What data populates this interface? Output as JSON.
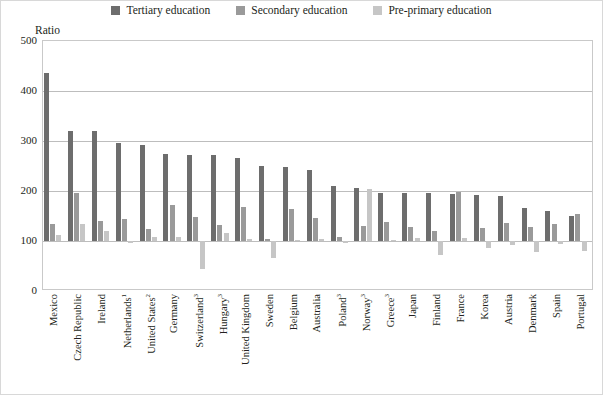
{
  "chart_data": {
    "type": "bar",
    "title": "",
    "ylabel": "Ratio",
    "xlabel": "",
    "ylim": [
      0,
      500
    ],
    "yticks": [
      0,
      100,
      200,
      300,
      400,
      500
    ],
    "baseline": 100,
    "grid": true,
    "legend_position": "top-center",
    "categories": [
      "Mexico",
      "Czech Republic",
      "Ireland",
      "Netherlands¹",
      "United States²",
      "Germany",
      "Switzerland³",
      "Hungary³",
      "United Kingdom",
      "Sweden",
      "Belgium",
      "Australia",
      "Poland³",
      "Norway³",
      "Greece³",
      "Japan",
      "Finland",
      "France",
      "Korea",
      "Austria",
      "Denmark",
      "Spain",
      "Portugal"
    ],
    "series": [
      {
        "name": "Tertiary education",
        "color": "#6d6d6d",
        "values": [
          437,
          320,
          320,
          297,
          293,
          275,
          272,
          272,
          266,
          250,
          248,
          243,
          210,
          207,
          197,
          196,
          196,
          194,
          192,
          190,
          166,
          161,
          150
        ]
      },
      {
        "name": "Secondary education",
        "color": "#9a9a9a",
        "values": [
          135,
          196,
          140,
          144,
          125,
          172,
          148,
          132,
          168,
          105,
          165,
          146,
          108,
          130,
          139,
          128,
          121,
          198,
          126,
          136,
          128,
          134,
          155
        ]
      },
      {
        "name": "Pre-primary education",
        "color": "#c6c6c6",
        "values": [
          112,
          135,
          120,
          96,
          108,
          108,
          45,
          117,
          105,
          67,
          102,
          105,
          96,
          205,
          103,
          107,
          72,
          107,
          86,
          93,
          78,
          95,
          81
        ]
      }
    ]
  },
  "legend": {
    "items": [
      {
        "label": "Tertiary education",
        "color": "#6d6d6d",
        "icon": "square-swatch-icon"
      },
      {
        "label": "Secondary education",
        "color": "#9a9a9a",
        "icon": "square-swatch-icon"
      },
      {
        "label": "Pre-primary education",
        "color": "#c6c6c6",
        "icon": "square-swatch-icon"
      }
    ]
  },
  "axis": {
    "y_title": "Ratio"
  }
}
